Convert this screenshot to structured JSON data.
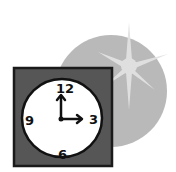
{
  "illustration": {
    "subject": "clock-with-sun",
    "colors": {
      "background": "#ffffff",
      "backdrop_circle": "#b9b9b9",
      "sun": "#e4e4e4",
      "frame": "#565656",
      "frame_border": "#1a1a1a",
      "clock_face": "#ffffff",
      "ink": "#111111"
    },
    "clock": {
      "numerals": {
        "twelve": "12",
        "three": "3",
        "six": "6",
        "nine": "9"
      },
      "time_shown": "3:00"
    }
  }
}
